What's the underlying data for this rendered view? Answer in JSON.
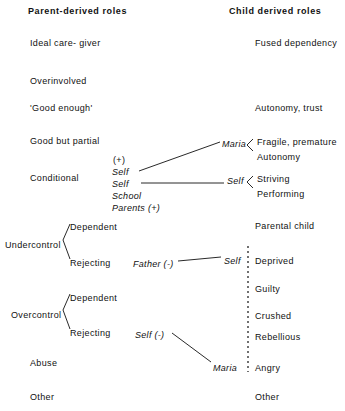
{
  "headers": {
    "left": "Parent-derived roles",
    "right": "Child derived roles"
  },
  "parent_roles": [
    {
      "label": "Ideal care- giver",
      "x": 30,
      "y": 38
    },
    {
      "label": "Overinvolved",
      "x": 30,
      "y": 76
    },
    {
      "label": "'Good enough'",
      "x": 30,
      "y": 103
    },
    {
      "label": "Good but partial",
      "x": 30,
      "y": 136
    },
    {
      "label": "Conditional",
      "x": 30,
      "y": 173
    },
    {
      "label": "Undercontrol",
      "x": 5,
      "y": 240
    },
    {
      "label": "Overcontrol",
      "x": 11,
      "y": 310
    },
    {
      "label": "Abuse",
      "x": 30,
      "y": 358
    },
    {
      "label": "Other",
      "x": 30,
      "y": 392
    }
  ],
  "parent_subroles": [
    {
      "label": "Dependent",
      "x": 70,
      "y": 222
    },
    {
      "label": "Rejecting",
      "x": 70,
      "y": 258
    },
    {
      "label": "Dependent",
      "x": 70,
      "y": 293
    },
    {
      "label": "Rejecting",
      "x": 70,
      "y": 328
    }
  ],
  "middle_block": [
    {
      "label": "(+)",
      "x": 113,
      "y": 155,
      "italic": false
    },
    {
      "label": "Self",
      "x": 112,
      "y": 167,
      "italic": true
    },
    {
      "label": "Self",
      "x": 112,
      "y": 179,
      "italic": true
    },
    {
      "label": "School",
      "x": 112,
      "y": 191,
      "italic": true
    },
    {
      "label": "Parents (+)",
      "x": 112,
      "y": 203,
      "italic": true
    }
  ],
  "annotations": [
    {
      "label": "Maria",
      "x": 222,
      "y": 139,
      "italic": true
    },
    {
      "label": "Self",
      "x": 227,
      "y": 176,
      "italic": true
    },
    {
      "label": "Father (-)",
      "x": 133,
      "y": 259,
      "italic": true
    },
    {
      "label": "Self",
      "x": 224,
      "y": 256,
      "italic": true
    },
    {
      "label": "Self (-)",
      "x": 135,
      "y": 330,
      "italic": true
    },
    {
      "label": "Maria",
      "x": 213,
      "y": 363,
      "italic": true
    }
  ],
  "child_roles": [
    {
      "label": "Fused dependency",
      "x": 255,
      "y": 38
    },
    {
      "label": "Autonomy, trust",
      "x": 255,
      "y": 103
    },
    {
      "label": "Fragile, premature",
      "x": 257,
      "y": 137
    },
    {
      "label": "Autonomy",
      "x": 257,
      "y": 152
    },
    {
      "label": "Striving",
      "x": 257,
      "y": 174
    },
    {
      "label": "Performing",
      "x": 257,
      "y": 189
    },
    {
      "label": "Parental child",
      "x": 255,
      "y": 221
    },
    {
      "label": "Deprived",
      "x": 255,
      "y": 256
    },
    {
      "label": "Guilty",
      "x": 255,
      "y": 284
    },
    {
      "label": "Crushed",
      "x": 255,
      "y": 311
    },
    {
      "label": "Rebellious",
      "x": 255,
      "y": 332
    },
    {
      "label": "Angry",
      "x": 255,
      "y": 363
    },
    {
      "label": "Other",
      "x": 255,
      "y": 392
    }
  ],
  "connectors": {
    "maria_diagonal": {
      "x1": 139,
      "y1": 171,
      "x2": 220,
      "y2": 142
    },
    "self_horizontal": {
      "x1": 141,
      "y1": 183,
      "x2": 224,
      "y2": 183
    },
    "father_to_self": {
      "x1": 178,
      "y1": 261,
      "x2": 221,
      "y2": 257
    },
    "self_to_maria": {
      "x1": 172,
      "y1": 333,
      "x2": 211,
      "y2": 362
    },
    "undercontrol_bracket": {
      "x": 63,
      "y": 240
    },
    "overcontrol_bracket": {
      "x": 63,
      "y": 310
    },
    "bracket_fragile": {
      "x": 247,
      "y": 145
    },
    "bracket_striving": {
      "x": 247,
      "y": 182
    },
    "dashed_line": {
      "x": 248,
      "y1": 246,
      "y2": 372
    }
  },
  "colors": {
    "ink": "#111111",
    "background": "#ffffff"
  }
}
